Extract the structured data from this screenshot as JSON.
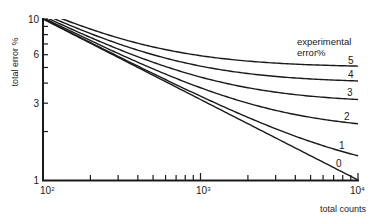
{
  "chart_data": {
    "type": "line",
    "title": "",
    "xlabel": "total counts",
    "ylabel": "total error %",
    "xscale": "log",
    "yscale": "log",
    "xlim": [
      100,
      10000
    ],
    "ylim": [
      1,
      10
    ],
    "grid": false,
    "x_tick_labels": [
      {
        "value": 100,
        "base": "10",
        "exp": "2"
      },
      {
        "value": 1000,
        "base": "10",
        "exp": "3"
      },
      {
        "value": 10000,
        "base": "10",
        "exp": "4"
      }
    ],
    "y_tick_labels": [
      {
        "value": 10,
        "label": "10"
      },
      {
        "value": 6,
        "label": "6"
      },
      {
        "value": 3,
        "label": "3"
      },
      {
        "value": 1,
        "label": "1"
      }
    ],
    "y_minor_ticks": [
      2,
      3,
      4,
      5,
      6,
      7,
      8,
      9
    ],
    "x_minor_ticks": [
      200,
      300,
      400,
      500,
      600,
      700,
      800,
      900,
      2000,
      3000,
      4000,
      5000,
      6000,
      7000,
      8000,
      9000
    ],
    "legend": {
      "title_line1": "experimental",
      "title_line2": "error%",
      "position": "right"
    },
    "x": [
      100,
      150,
      200,
      300,
      500,
      700,
      1000,
      1500,
      2000,
      3000,
      5000,
      7000,
      10000
    ],
    "series": [
      {
        "name": "0",
        "label": "0",
        "values": [
          10.0,
          8.16,
          7.07,
          5.77,
          4.47,
          3.78,
          3.16,
          2.58,
          2.24,
          1.83,
          1.41,
          1.2,
          1.0
        ]
      },
      {
        "name": "1",
        "label": "1",
        "values": [
          10.05,
          8.23,
          7.14,
          5.86,
          4.58,
          3.91,
          3.32,
          2.77,
          2.45,
          2.08,
          1.73,
          1.56,
          1.41
        ]
      },
      {
        "name": "2",
        "label": "2",
        "values": [
          10.2,
          8.41,
          7.35,
          6.11,
          4.9,
          4.29,
          3.74,
          3.27,
          3.0,
          2.71,
          2.45,
          2.33,
          2.24
        ]
      },
      {
        "name": "3",
        "label": "3",
        "values": [
          10.44,
          8.7,
          7.68,
          6.51,
          5.39,
          4.83,
          4.36,
          3.96,
          3.74,
          3.51,
          3.32,
          3.23,
          3.16
        ]
      },
      {
        "name": "4",
        "label": "4",
        "values": [
          10.77,
          9.09,
          8.12,
          7.02,
          6.0,
          5.49,
          5.1,
          4.76,
          4.58,
          4.4,
          4.24,
          4.17,
          4.12
        ]
      },
      {
        "name": "5",
        "label": "5",
        "values": [
          11.18,
          9.57,
          8.66,
          7.64,
          6.71,
          6.25,
          5.92,
          5.63,
          5.48,
          5.32,
          5.2,
          5.14,
          5.1
        ]
      }
    ],
    "model": "total_error = sqrt(experimental_error^2 + 10000/total_counts)"
  },
  "labels": {
    "ylabel": "total error %",
    "xlabel": "total counts",
    "legend_line1": "experimental",
    "legend_line2": "error%",
    "y10": "10",
    "y6": "6",
    "y3": "3",
    "y1": "1",
    "x2_base": "10",
    "x2_exp": "2",
    "x3_base": "10",
    "x3_exp": "3",
    "x4_base": "10",
    "x4_exp": "4",
    "c0": "0",
    "c1": "1",
    "c2": "2",
    "c3": "3",
    "c4": "4",
    "c5": "5"
  },
  "colors": {
    "ink": "#1a1a1a",
    "background": "#ffffff"
  }
}
